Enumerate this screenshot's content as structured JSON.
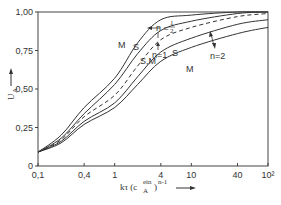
{
  "chart_data": {
    "type": "line",
    "title": "",
    "xlabel": "kτ (c_A^ein)^(n-1)",
    "ylabel": "U_A",
    "xscale": "log",
    "xlim": [
      0.1,
      100
    ],
    "ylim": [
      0,
      1.0
    ],
    "grid": false,
    "legend": "inline curve labels",
    "x_ticks": [
      0.1,
      0.4,
      1,
      4,
      10,
      40,
      100
    ],
    "x_tick_labels": [
      "0,1",
      "0,4",
      "1",
      "4",
      "10",
      "40",
      "10²"
    ],
    "y_ticks": [
      0,
      0.25,
      0.5,
      0.75,
      1.0
    ],
    "y_tick_labels": [
      "0",
      "0,25",
      "0,50",
      "0,75",
      "1,00"
    ],
    "x": [
      0.1,
      0.2,
      0.4,
      1,
      2,
      4,
      10,
      40,
      100
    ],
    "series": [
      {
        "name": "n=1/2, M",
        "style": "solid",
        "values": [
          0.09,
          0.2,
          0.38,
          0.57,
          0.8,
          0.95,
          0.98,
          1.0,
          1.0
        ]
      },
      {
        "name": "n=1/2, S",
        "style": "solid",
        "values": [
          0.09,
          0.18,
          0.34,
          0.53,
          0.73,
          0.88,
          0.94,
          0.99,
          1.0
        ]
      },
      {
        "name": "n=1, S,M",
        "style": "dashed",
        "values": [
          0.09,
          0.17,
          0.32,
          0.46,
          0.65,
          0.82,
          0.9,
          0.97,
          0.99
        ]
      },
      {
        "name": "n=2, S",
        "style": "solid",
        "values": [
          0.09,
          0.16,
          0.29,
          0.41,
          0.58,
          0.74,
          0.83,
          0.92,
          0.95
        ]
      },
      {
        "name": "n=2, M",
        "style": "solid",
        "values": [
          0.09,
          0.15,
          0.27,
          0.38,
          0.53,
          0.68,
          0.77,
          0.86,
          0.9
        ]
      }
    ],
    "annotations": [
      "M",
      "S",
      "n=1/2",
      "n=1",
      "S,M",
      "S",
      "M",
      "n=2"
    ]
  },
  "labels": {
    "y_axis": "U",
    "y_axis_sub": "A",
    "x_axis_main": "kτ (c",
    "x_axis_sub": "A",
    "x_axis_sup": "ein",
    "x_axis_tail": ")",
    "x_axis_exp": "n-1",
    "curve_M_top": "M",
    "curve_S_top": "S",
    "n_half": "n = ",
    "n_half_num": "1",
    "n_half_den": "2",
    "n_one": "n=1",
    "curve_SM": "S,M",
    "curve_S_n2": "S",
    "curve_M_n2": "M",
    "n_two": "n=2"
  }
}
